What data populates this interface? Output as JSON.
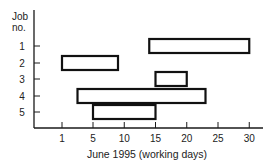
{
  "chart_data": {
    "type": "gantt",
    "title": "",
    "xlabel": "June 1995 (working days)",
    "ylabel": "Job no.",
    "ylabel_lines": [
      "Job",
      "no."
    ],
    "x_ticks": [
      1,
      5,
      10,
      15,
      20,
      25,
      30
    ],
    "y_ticks": [
      1,
      2,
      3,
      4,
      5
    ],
    "xlim": [
      0,
      33
    ],
    "grid": false,
    "legend": null,
    "tasks": [
      {
        "job": 1,
        "start": 14,
        "end": 30
      },
      {
        "job": 2,
        "start": 1,
        "end": 9
      },
      {
        "job": 3,
        "start": 15,
        "end": 20
      },
      {
        "job": 4,
        "start": 3,
        "end": 23
      },
      {
        "job": 5,
        "start": 5,
        "end": 15
      }
    ]
  },
  "colors": {
    "axis": "#1a1a1a",
    "bar_fill": "#ffffff",
    "bar_stroke": "#111111",
    "text": "#222222"
  }
}
